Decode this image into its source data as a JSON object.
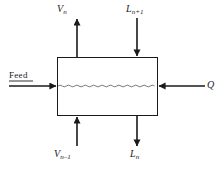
{
  "diagram": {
    "type": "process-flow-block",
    "background_color": "#ffffff",
    "line_color": "#1a1a1a",
    "vessel": {
      "name": "stage-vessel",
      "shape": "rectangle",
      "x": 57,
      "y": 57,
      "width": 101,
      "height": 59,
      "interior_feature": "wavy-liquid-level-line",
      "interior_feature_y": 86
    },
    "streams": [
      {
        "id": "vapor-out",
        "label_main": "V",
        "label_sub": "n",
        "direction": "up",
        "orientation": "vertical",
        "side": "top",
        "x": 77,
        "from_y": 57,
        "to_y": 18
      },
      {
        "id": "liquid-in",
        "label_main": "L",
        "label_sub": "n+1",
        "direction": "down",
        "orientation": "vertical",
        "side": "top",
        "x": 137,
        "from_y": 18,
        "to_y": 57
      },
      {
        "id": "vapor-in",
        "label_main": "V",
        "label_sub": "n−1",
        "direction": "up",
        "orientation": "vertical",
        "side": "bottom",
        "x": 77,
        "from_y": 146,
        "to_y": 116
      },
      {
        "id": "liquid-out",
        "label_main": "L",
        "label_sub": "n",
        "direction": "down",
        "orientation": "vertical",
        "side": "bottom",
        "x": 137,
        "from_y": 116,
        "to_y": 146
      },
      {
        "id": "feed-in",
        "label_main": "Feed",
        "label_sub": "",
        "direction": "right",
        "orientation": "horizontal",
        "side": "left",
        "y": 86,
        "from_x": 9,
        "to_x": 57,
        "underlined": true
      },
      {
        "id": "heat-duty",
        "label_main": "Q",
        "label_sub": "",
        "direction": "left",
        "orientation": "horizontal",
        "side": "right",
        "y": 86,
        "from_x": 205,
        "to_x": 158
      }
    ]
  },
  "labels": {
    "vn": {
      "main": "V",
      "sub": "n"
    },
    "ln_plus_1": {
      "main": "L",
      "sub": "n+1"
    },
    "vn_minus_1": {
      "main": "V",
      "sub": "n–1"
    },
    "ln": {
      "main": "L",
      "sub": "n"
    },
    "feed": {
      "main": "Feed"
    },
    "q": {
      "main": "Q"
    }
  }
}
